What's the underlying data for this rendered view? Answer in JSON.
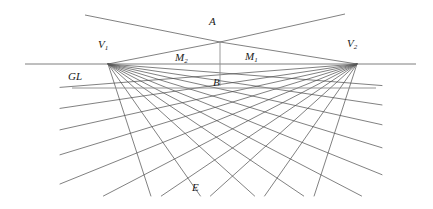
{
  "figure": {
    "type": "two-point-perspective-construction",
    "width": 433,
    "height": 209,
    "background_color": "#ffffff",
    "line_color": "#444444",
    "label_color": "#1a1a1a"
  },
  "labels": {
    "vanishing_point_left": "V",
    "vanishing_point_left_sub": "1",
    "vanishing_point_right": "V",
    "vanishing_point_right_sub": "2",
    "apex": "A",
    "base": "B",
    "measuring_point_right": "M",
    "measuring_point_right_sub": "1",
    "measuring_point_left": "M",
    "measuring_point_left_sub": "2",
    "ground_line": "GL",
    "eye_point": "E"
  },
  "geometry": {
    "horizon_line": {
      "x1": 25,
      "y1": 64,
      "x2": 416,
      "y2": 64
    },
    "ground_line": {
      "x1": 72,
      "y1": 88,
      "x2": 376,
      "y2": 88
    },
    "vertical_ab": {
      "x1": 220,
      "y1": 42,
      "x2": 220,
      "y2": 86
    },
    "points": {
      "V1": {
        "x": 108,
        "y": 64
      },
      "V2": {
        "x": 357,
        "y": 64
      },
      "A": {
        "x": 220,
        "y": 42
      },
      "B": {
        "x": 220,
        "y": 86
      }
    },
    "apex_rays": [
      {
        "x1": 85,
        "y1": 15,
        "x2": 345,
        "y2": 14
      },
      {
        "x1": 345,
        "y1": 14,
        "x2": 85,
        "y2": 15
      }
    ],
    "fan_from_V1_count": 9,
    "fan_from_V2_count": 9
  }
}
